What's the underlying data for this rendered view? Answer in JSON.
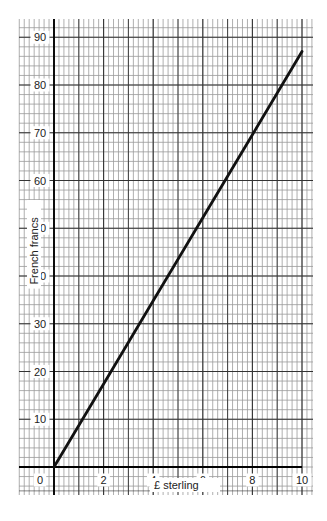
{
  "chart_data": {
    "type": "line",
    "title": "",
    "xlabel": "£ sterling",
    "ylabel": "French francs",
    "xlim": [
      0,
      10
    ],
    "ylim": [
      0,
      90
    ],
    "x_ticks": [
      0,
      2,
      4,
      6,
      8,
      10
    ],
    "x_tick_labels": [
      "0",
      "2",
      "4",
      "6",
      "8",
      "10"
    ],
    "y_ticks": [
      10,
      20,
      30,
      40,
      50,
      60,
      70,
      80,
      90
    ],
    "y_tick_labels": [
      "10",
      "20",
      "30",
      "40",
      "50",
      "60",
      "70",
      "80",
      "90"
    ],
    "grid": true,
    "grid_style": "graph paper (major every 1 unit x / 10 units y, 5 minor subdivisions)",
    "legend": null,
    "series": [
      {
        "name": "Conversion £ sterling to French francs",
        "color": "#111111",
        "x": [
          0,
          2,
          4,
          6,
          8,
          10
        ],
        "y": [
          0,
          17.4,
          34.8,
          52.2,
          69.6,
          87
        ]
      }
    ]
  },
  "colors": {
    "background": "#ffffff",
    "grid_minor": "#9a9a9a",
    "grid_major": "#333333",
    "line": "#111111"
  }
}
